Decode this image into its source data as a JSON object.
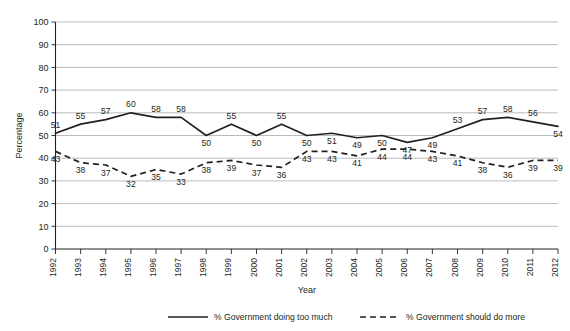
{
  "chart_data": {
    "type": "line",
    "title": "",
    "xlabel": "Year",
    "ylabel": "Percentage",
    "ylim": [
      0,
      100
    ],
    "ytick_step": 10,
    "yticks": [
      "0",
      "10",
      "20",
      "30",
      "40",
      "50",
      "60",
      "70",
      "80",
      "90",
      "100"
    ],
    "grid": "horizontal",
    "legend_position": "bottom",
    "categories": [
      "1992",
      "1993",
      "1994",
      "1995",
      "1996",
      "1997",
      "1998",
      "1999",
      "2000",
      "2001",
      "2002",
      "2003",
      "2004",
      "2005",
      "2006",
      "2007",
      "2008",
      "2009",
      "2010",
      "2011",
      "2012"
    ],
    "series": [
      {
        "name": "% Government doing too much",
        "style": "solid",
        "values": [
          51,
          55,
          57,
          60,
          58,
          58,
          50,
          55,
          50,
          55,
          50,
          51,
          49,
          50,
          47,
          49,
          53,
          57,
          58,
          56,
          54
        ],
        "label_pos": [
          "above",
          "above",
          "above",
          "above",
          "above",
          "above",
          "below",
          "above",
          "below",
          "above",
          "below",
          "below",
          "below",
          "below",
          "below",
          "below",
          "above",
          "above",
          "above",
          "above",
          "below"
        ]
      },
      {
        "name": "% Government should do more",
        "style": "dashed",
        "values": [
          43,
          38,
          37,
          32,
          35,
          33,
          38,
          39,
          37,
          36,
          43,
          43,
          41,
          44,
          44,
          43,
          41,
          38,
          36,
          39,
          39
        ],
        "label_pos": [
          "below",
          "below",
          "below",
          "below",
          "below",
          "below",
          "below",
          "below",
          "below",
          "below",
          "below",
          "below",
          "below",
          "below",
          "below",
          "below",
          "below",
          "below",
          "below",
          "below",
          "below"
        ]
      }
    ]
  },
  "legend": {
    "items": [
      {
        "label": "% Government doing too much",
        "style": "solid"
      },
      {
        "label": "% Government should do more",
        "style": "dashed"
      }
    ]
  },
  "colors": {
    "ink": "#231f20",
    "grid": "#a7a9ac",
    "background": "#ffffff"
  }
}
